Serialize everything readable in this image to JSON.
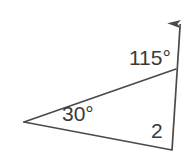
{
  "figure": {
    "type": "geometry-diagram",
    "background_color": "#ffffff",
    "stroke_color": "#4a4a4a",
    "text_color": "#3a3a3a",
    "labels": {
      "interior_angle_top": "115°",
      "interior_angle_left": "30°",
      "exterior_angle_number": "2"
    },
    "points": {
      "left_vertex": {
        "x": 24,
        "y": 122
      },
      "top_right_vertex": {
        "x": 176,
        "y": 69
      },
      "bottom_right_vertex": {
        "x": 172,
        "y": 150
      },
      "ray_tip": {
        "x": 181,
        "y": 11
      }
    },
    "segments": [
      {
        "name": "upper-side",
        "from": "left_vertex",
        "to": "top_right_vertex"
      },
      {
        "name": "lower-side",
        "from": "left_vertex",
        "to": "bottom_right_vertex"
      },
      {
        "name": "right-side-ray",
        "from": "bottom_right_vertex",
        "to": "ray_tip"
      }
    ]
  }
}
